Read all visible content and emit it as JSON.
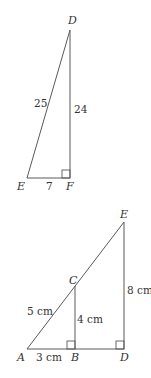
{
  "diagram1": {
    "vertices": {
      "D": {
        "label": "D"
      },
      "E": {
        "label": "E"
      },
      "F": {
        "label": "F"
      }
    },
    "sides": {
      "DE": "25",
      "DF": "24",
      "EF": "7"
    },
    "right_angle_at": "F"
  },
  "diagram2": {
    "vertices": {
      "A": {
        "label": "A"
      },
      "B": {
        "label": "B"
      },
      "C": {
        "label": "C"
      },
      "D": {
        "label": "D"
      },
      "E": {
        "label": "E"
      }
    },
    "sides": {
      "AC": "5 cm",
      "BC": "4 cm",
      "AB": "3 cm",
      "DE": "8 cm"
    },
    "right_angles_at": [
      "B",
      "D"
    ]
  },
  "colors": {
    "line": "#5a5a5a",
    "text": "#333333",
    "background": "#ffffff"
  }
}
